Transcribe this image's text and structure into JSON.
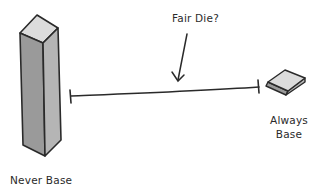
{
  "diagram": {
    "title_annotation": "Fair Die?",
    "left_end_label": "Never Base",
    "right_end_label_line1": "Always",
    "right_end_label_line2": "Base",
    "elements": [
      {
        "name": "tall-block",
        "meaning": "Never Base extreme"
      },
      {
        "name": "spectrum-line",
        "meaning": "continuum between extremes"
      },
      {
        "name": "arrow",
        "meaning": "points to middle of spectrum"
      },
      {
        "name": "flat-block",
        "meaning": "Always Base extreme"
      }
    ],
    "colors": {
      "stroke": "#2a2a2a",
      "block_front": "#9a9a9a",
      "block_side": "#b5b5b5",
      "block_top": "#dcdcdc"
    }
  }
}
